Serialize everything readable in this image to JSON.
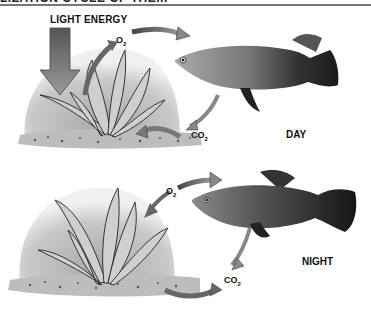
{
  "header": {
    "title_partial": "LIZATION CYCLE OF THE..."
  },
  "labels": {
    "light_energy": "LIGHT ENERGY",
    "day": "DAY",
    "night": "NIGHT"
  },
  "chemicals": {
    "day_o2": {
      "base": "O",
      "sub": "2"
    },
    "day_co2": {
      "base": "CO",
      "sub": "2"
    },
    "night_o2": {
      "base": "O",
      "sub": "2"
    },
    "night_co2": {
      "base": "CO",
      "sub": "2"
    }
  },
  "panels": [
    {
      "name": "day",
      "elements": [
        "light-energy-arrow",
        "plant",
        "fish",
        "o2-arrow plant-to-fish",
        "co2-arrow fish-to-plant",
        "light-arrow into plant"
      ]
    },
    {
      "name": "night",
      "elements": [
        "plant",
        "fish",
        "o2-arrow plant-to-fish",
        "co2-arrow fish-to-substrate",
        "co2-arrow plant-outward"
      ]
    }
  ],
  "colors": {
    "background": "#ffffff",
    "shading_dark": "#8a8a8a",
    "shading_light": "#d6d6d6",
    "fish_body": "#7a7a7a",
    "fish_tail": "#1e1e1e",
    "text": "#111111"
  }
}
